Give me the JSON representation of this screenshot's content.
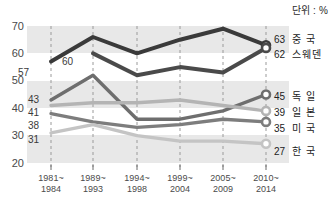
{
  "unit_note": "단위 : %",
  "chart_data": {
    "type": "line",
    "title": "",
    "xlabel": "",
    "ylabel": "",
    "ylim": [
      20,
      70
    ],
    "yticks": [
      20,
      30,
      40,
      50,
      60,
      70
    ],
    "grid": "vertical-dashed",
    "legend_position": "right",
    "categories": [
      "1981~\n1984",
      "1989~\n1993",
      "1994~\n1998",
      "1999~\n2004",
      "2005~\n2009",
      "2010~\n2014"
    ],
    "category_lines": [
      [
        "1981~",
        "1984"
      ],
      [
        "1989~",
        "1993"
      ],
      [
        "1994~",
        "1998"
      ],
      [
        "1999~",
        "2004"
      ],
      [
        "2005~",
        "2009"
      ],
      [
        "2010~",
        "2014"
      ]
    ],
    "series": [
      {
        "name": "중 국",
        "color": "#3a3a3a",
        "values": [
          57,
          66,
          60,
          65,
          69,
          63
        ],
        "end_value": 63,
        "start_label": "57"
      },
      {
        "name": "스웨덴",
        "color": "#4a4a4a",
        "values": [
          null,
          60,
          52,
          55,
          53,
          62
        ],
        "end_value": 62,
        "start_label": "60"
      },
      {
        "name": "독 일",
        "color": "#6e6e6e",
        "values": [
          43,
          52,
          36,
          36,
          39,
          45
        ],
        "end_value": 45,
        "start_label": "43"
      },
      {
        "name": "일 본",
        "color": "#b4b4b4",
        "values": [
          41,
          42,
          42,
          43,
          41,
          39
        ],
        "end_value": 39,
        "start_label": "41"
      },
      {
        "name": "미 국",
        "color": "#7d7d7d",
        "values": [
          38,
          35,
          33,
          34,
          36,
          35
        ],
        "end_value": 35,
        "start_label": "38"
      },
      {
        "name": "한 국",
        "color": "#c4c4c4",
        "values": [
          31,
          34,
          30,
          28,
          28,
          27
        ],
        "end_value": 27,
        "start_label": "31"
      }
    ],
    "start_labels": [
      {
        "text": "57",
        "x": 18,
        "y": 68
      },
      {
        "text": "43",
        "x": 28,
        "y": 95
      },
      {
        "text": "41",
        "x": 28,
        "y": 108
      },
      {
        "text": "38",
        "x": 28,
        "y": 121
      },
      {
        "text": "31",
        "x": 28,
        "y": 135
      },
      {
        "text": "60",
        "x": 62,
        "y": 57
      }
    ],
    "legend_entries": [
      {
        "value": "63",
        "name": "중 국",
        "y": 35
      },
      {
        "value": "62",
        "name": "스웨덴",
        "y": 50
      },
      {
        "value": "45",
        "name": "독 일",
        "y": 92
      },
      {
        "value": "39",
        "name": "일 본",
        "y": 108
      },
      {
        "value": "35",
        "name": "미 국",
        "y": 124
      },
      {
        "value": "27",
        "name": "한 국",
        "y": 147
      }
    ]
  }
}
